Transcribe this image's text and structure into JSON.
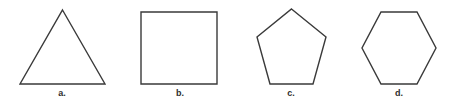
{
  "figure": {
    "background_color": "#ffffff",
    "stroke_color": "#3a3a3a",
    "stroke_width": 1.4,
    "width": 454,
    "height": 102,
    "caption_color": "#2e2e2e"
  },
  "shapes": [
    {
      "key": "triangle",
      "name": "equilateral-triangle",
      "sides": 3,
      "label": "a.",
      "label_x": 62,
      "label_y": 89,
      "points": "62.5,10 105,84 20,84"
    },
    {
      "key": "square",
      "name": "square",
      "sides": 4,
      "label": "b.",
      "label_x": 180,
      "label_y": 89,
      "points": "141,12 217,12 217,84 141,84"
    },
    {
      "key": "pentagon",
      "name": "regular-pentagon",
      "sides": 5,
      "label": "c.",
      "label_x": 291,
      "label_y": 89,
      "points": "291.5,9 326,37 313,84 270,84 257,37"
    },
    {
      "key": "hexagon",
      "name": "regular-hexagon",
      "sides": 6,
      "label": "d.",
      "label_x": 399,
      "label_y": 89,
      "points": "381,12 417,12 436,48 417,84 381,84 362,48"
    }
  ]
}
